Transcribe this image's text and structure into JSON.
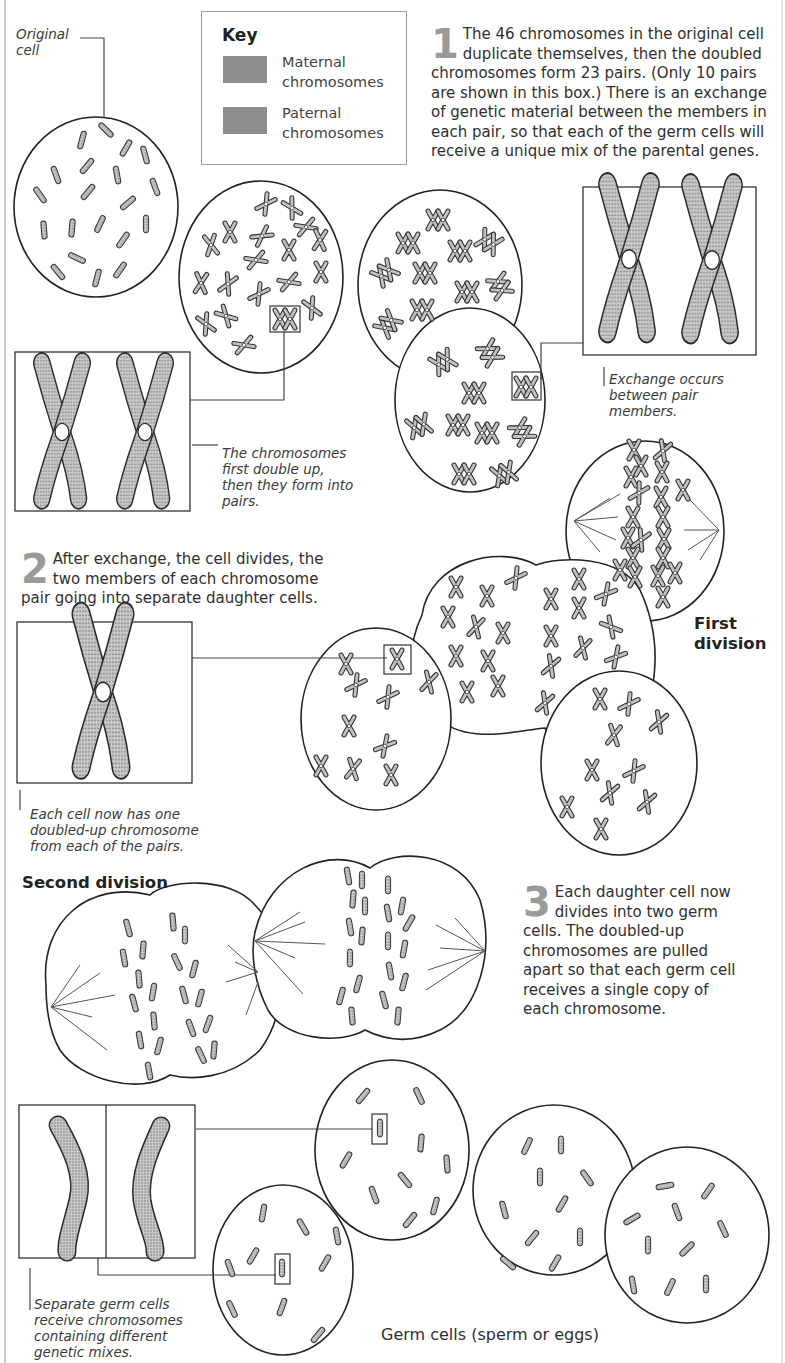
{
  "labels": {
    "original_cell": "Original cell",
    "chromosomes_double": "The chromosomes first double up, then they form into pairs.",
    "exchange_occurs": "Exchange occurs between pair members.",
    "each_cell_now": "Each cell now has one doubled-up chromosome from each of the pairs.",
    "separate_germ": "Separate germ cells receive chromosomes containing different genetic mixes."
  },
  "key": {
    "title": "Key",
    "items": [
      {
        "label": "Maternal chromosomes",
        "color": "#8e8e8e"
      },
      {
        "label": "Paternal chromosomes",
        "color": "#8e8e8e"
      }
    ]
  },
  "steps": [
    {
      "number": "1",
      "text": "The 46 chromosomes in the original cell duplicate themselves, then the doubled chromosomes form 23 pairs. (Only 10 pairs are shown in this box.) There is an exchange of genetic material between the members in each pair, so that each of the germ cells will receive a unique mix of the parental genes."
    },
    {
      "number": "2",
      "text": "After exchange, the cell divides, the two members of each chromosome pair going into separate daughter cells."
    },
    {
      "number": "3",
      "text": "Each daughter cell now divides into two germ cells. The doubled-up chromosomes are pulled apart so that each germ cell receives a single copy of each chromosome."
    }
  ],
  "headings": {
    "first_division": "First division",
    "second_division": "Second division",
    "germ_cells": "Germ cells (sperm or eggs)"
  },
  "colors": {
    "line": "#222222",
    "chromosome_fill": "#b5b5b5",
    "step_number": "#9a9a9a"
  }
}
